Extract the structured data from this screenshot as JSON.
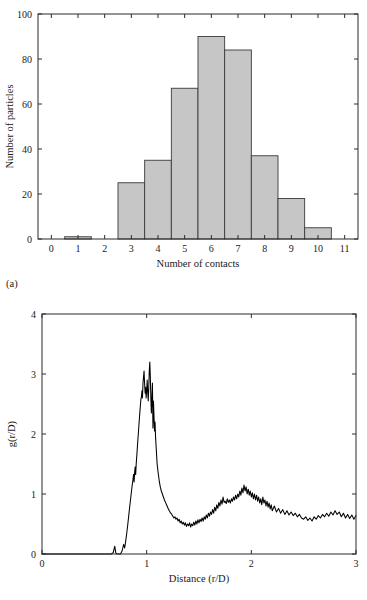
{
  "figure": {
    "panels": [
      {
        "key": "a",
        "label": "(a)"
      },
      {
        "key": "b",
        "label": "(b)"
      }
    ]
  },
  "panel_a": {
    "label": "(a)",
    "xlabel": "Number of contacts",
    "ylabel": "Number of particles",
    "xticks": [
      "0",
      "1",
      "2",
      "3",
      "4",
      "5",
      "6",
      "7",
      "8",
      "9",
      "10",
      "11"
    ],
    "yticks": [
      "0",
      "20",
      "40",
      "60",
      "80",
      "100"
    ]
  },
  "panel_b": {
    "label": "(b)",
    "xlabel_prefix": "Distance (",
    "xlabel_r": "r",
    "xlabel_slash": "/",
    "xlabel_D": "D",
    "xlabel_suffix": ")",
    "ylabel_prefix": "g(",
    "ylabel_r": "r",
    "ylabel_slash": "/",
    "ylabel_D": "D",
    "ylabel_suffix": ")",
    "xticks": [
      "0",
      "1",
      "2",
      "3"
    ],
    "yticks": [
      "0",
      "1",
      "2",
      "3",
      "4"
    ]
  },
  "colors": {
    "bar_fill": "#c6c6c6",
    "bar_edge": "#3a3a3a",
    "axis": "#2b2b2b",
    "curve": "#000000",
    "background": "#ffffff"
  },
  "chart_data": [
    {
      "type": "bar",
      "panel": "a",
      "title": "",
      "xlabel": "Number of contacts",
      "ylabel": "Number of particles",
      "categories": [
        0,
        1,
        2,
        3,
        4,
        5,
        6,
        7,
        8,
        9,
        10,
        11
      ],
      "values": [
        0,
        1,
        0,
        25,
        35,
        67,
        90,
        84,
        37,
        18,
        5,
        0
      ],
      "xlim": [
        -0.5,
        11.5
      ],
      "ylim": [
        0,
        100
      ],
      "xtick_values": [
        0,
        1,
        2,
        3,
        4,
        5,
        6,
        7,
        8,
        9,
        10,
        11
      ],
      "ytick_values": [
        0,
        20,
        40,
        60,
        80,
        100
      ],
      "grid": false,
      "legend": null,
      "bar_width": 1.0
    },
    {
      "type": "line",
      "panel": "b",
      "title": "",
      "xlabel": "Distance (r/D)",
      "ylabel": "g(r/D)",
      "xlim": [
        0,
        3
      ],
      "ylim": [
        0,
        4
      ],
      "xtick_values": [
        0,
        1,
        2,
        3
      ],
      "ytick_values": [
        0,
        1,
        2,
        3,
        4
      ],
      "grid": false,
      "legend": null,
      "annotations": [
        {
          "text": "first peak",
          "x": 1.02,
          "y": 3.2
        },
        {
          "text": "first minimum",
          "x": 1.4,
          "y": 0.46
        },
        {
          "text": "second peak",
          "x": 1.86,
          "y": 1.15
        }
      ],
      "x": [
        0.0,
        0.04,
        0.08,
        0.12,
        0.16,
        0.2,
        0.24,
        0.28,
        0.32,
        0.36,
        0.4,
        0.44,
        0.48,
        0.52,
        0.56,
        0.6,
        0.64,
        0.66,
        0.68,
        0.695,
        0.705,
        0.715,
        0.725,
        0.735,
        0.75,
        0.765,
        0.78,
        0.79,
        0.8,
        0.81,
        0.82,
        0.83,
        0.84,
        0.85,
        0.86,
        0.87,
        0.875,
        0.88,
        0.885,
        0.89,
        0.895,
        0.9,
        0.905,
        0.91,
        0.915,
        0.92,
        0.925,
        0.93,
        0.935,
        0.94,
        0.945,
        0.95,
        0.955,
        0.96,
        0.965,
        0.97,
        0.975,
        0.98,
        0.985,
        0.99,
        0.995,
        1.0,
        1.005,
        1.01,
        1.015,
        1.02,
        1.025,
        1.03,
        1.035,
        1.04,
        1.045,
        1.05,
        1.055,
        1.06,
        1.065,
        1.07,
        1.075,
        1.08,
        1.085,
        1.09,
        1.095,
        1.1,
        1.11,
        1.12,
        1.13,
        1.14,
        1.15,
        1.16,
        1.17,
        1.18,
        1.19,
        1.2,
        1.21,
        1.22,
        1.23,
        1.24,
        1.25,
        1.26,
        1.27,
        1.28,
        1.29,
        1.3,
        1.31,
        1.32,
        1.33,
        1.34,
        1.35,
        1.36,
        1.37,
        1.38,
        1.39,
        1.4,
        1.41,
        1.42,
        1.43,
        1.44,
        1.45,
        1.46,
        1.47,
        1.48,
        1.49,
        1.5,
        1.51,
        1.52,
        1.53,
        1.54,
        1.55,
        1.56,
        1.57,
        1.58,
        1.59,
        1.6,
        1.61,
        1.62,
        1.63,
        1.64,
        1.65,
        1.66,
        1.67,
        1.68,
        1.69,
        1.7,
        1.71,
        1.72,
        1.73,
        1.74,
        1.75,
        1.76,
        1.77,
        1.78,
        1.79,
        1.8,
        1.81,
        1.82,
        1.83,
        1.84,
        1.85,
        1.86,
        1.87,
        1.88,
        1.89,
        1.9,
        1.91,
        1.92,
        1.93,
        1.94,
        1.95,
        1.96,
        1.97,
        1.98,
        1.99,
        2.0,
        2.01,
        2.02,
        2.03,
        2.04,
        2.05,
        2.06,
        2.07,
        2.08,
        2.09,
        2.1,
        2.11,
        2.12,
        2.13,
        2.14,
        2.15,
        2.16,
        2.17,
        2.18,
        2.19,
        2.2,
        2.22,
        2.24,
        2.26,
        2.28,
        2.3,
        2.32,
        2.34,
        2.36,
        2.38,
        2.4,
        2.42,
        2.44,
        2.46,
        2.48,
        2.5,
        2.52,
        2.54,
        2.56,
        2.58,
        2.6,
        2.62,
        2.64,
        2.66,
        2.68,
        2.7,
        2.72,
        2.74,
        2.76,
        2.78,
        2.8,
        2.82,
        2.84,
        2.86,
        2.88,
        2.9,
        2.92,
        2.94,
        2.96,
        2.98,
        3.0
      ],
      "y": [
        0.0,
        0.0,
        0.0,
        0.0,
        0.0,
        0.0,
        0.0,
        0.0,
        0.0,
        0.0,
        0.0,
        0.0,
        0.0,
        0.0,
        0.0,
        0.0,
        0.0,
        0.0,
        0.02,
        0.13,
        0.02,
        0.0,
        0.0,
        0.0,
        0.0,
        0.05,
        0.16,
        0.1,
        0.22,
        0.35,
        0.5,
        0.66,
        0.82,
        0.97,
        1.12,
        1.25,
        1.33,
        1.2,
        1.36,
        1.45,
        1.32,
        1.5,
        1.62,
        1.75,
        1.88,
        2.0,
        2.12,
        2.25,
        2.36,
        2.48,
        2.58,
        2.62,
        2.72,
        2.6,
        2.85,
        2.95,
        3.05,
        2.85,
        2.68,
        2.78,
        2.6,
        2.72,
        2.9,
        2.7,
        2.55,
        2.78,
        3.05,
        3.2,
        2.95,
        2.6,
        2.35,
        2.6,
        2.85,
        2.1,
        2.55,
        2.3,
        2.05,
        2.2,
        1.95,
        1.8,
        1.65,
        1.5,
        1.35,
        1.22,
        1.12,
        1.05,
        1.0,
        0.95,
        0.9,
        0.86,
        0.82,
        0.78,
        0.74,
        0.71,
        0.68,
        0.66,
        0.63,
        0.6,
        0.62,
        0.58,
        0.6,
        0.55,
        0.58,
        0.52,
        0.55,
        0.5,
        0.53,
        0.48,
        0.52,
        0.46,
        0.5,
        0.47,
        0.52,
        0.45,
        0.5,
        0.47,
        0.53,
        0.48,
        0.55,
        0.5,
        0.57,
        0.52,
        0.58,
        0.54,
        0.6,
        0.55,
        0.62,
        0.58,
        0.65,
        0.6,
        0.68,
        0.63,
        0.7,
        0.66,
        0.74,
        0.68,
        0.78,
        0.72,
        0.82,
        0.76,
        0.86,
        0.8,
        0.9,
        0.83,
        0.95,
        0.86,
        0.88,
        0.84,
        0.92,
        0.86,
        0.9,
        0.85,
        0.92,
        0.88,
        0.95,
        0.9,
        0.98,
        0.92,
        1.0,
        0.95,
        1.05,
        0.98,
        1.1,
        1.02,
        1.15,
        1.05,
        1.12,
        1.0,
        1.08,
        0.98,
        1.05,
        0.95,
        1.02,
        0.92,
        1.0,
        0.9,
        0.98,
        0.88,
        0.95,
        0.85,
        0.92,
        0.82,
        0.95,
        0.85,
        0.9,
        0.8,
        0.88,
        0.78,
        0.85,
        0.75,
        0.82,
        0.72,
        0.8,
        0.7,
        0.76,
        0.68,
        0.74,
        0.66,
        0.72,
        0.65,
        0.7,
        0.64,
        0.68,
        0.62,
        0.66,
        0.6,
        0.58,
        0.62,
        0.56,
        0.6,
        0.55,
        0.62,
        0.58,
        0.64,
        0.6,
        0.66,
        0.62,
        0.68,
        0.63,
        0.7,
        0.65,
        0.72,
        0.66,
        0.7,
        0.62,
        0.68,
        0.6,
        0.66,
        0.59,
        0.65,
        0.58,
        0.64,
        0.6,
        0.67,
        0.62,
        0.7,
        0.63,
        0.68,
        0.6,
        0.66,
        0.58,
        0.62,
        0.55,
        0.6,
        0.57
      ]
    }
  ]
}
